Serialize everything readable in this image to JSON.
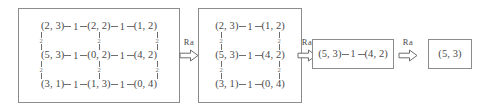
{
  "diagram": {
    "edge_label_horizontal": "1",
    "edge_label_vertical": "2",
    "arrow_label": "Ra",
    "arrows": [
      {
        "label": "Ra",
        "icon": "hollow-right-arrow-icon"
      },
      {
        "label": "Ra",
        "icon": "hollow-right-arrow-icon"
      },
      {
        "label": "Ra",
        "icon": "hollow-right-arrow-icon"
      }
    ],
    "steps": [
      {
        "id": "step-1",
        "rows": [
          {
            "nodes": [
              "(2, 3)",
              "(2, 2)",
              "(1, 2)"
            ],
            "h_labels": [
              "1",
              "1"
            ]
          },
          {
            "nodes": [
              "(5, 3)",
              "(0, 2)",
              "(4, 2)"
            ],
            "h_labels": [
              "1",
              "1"
            ]
          },
          {
            "nodes": [
              "(3, 1)",
              "(1, 3)",
              "(0, 4)"
            ],
            "h_labels": [
              "1",
              "1"
            ]
          }
        ],
        "v_labels": [
          [
            "2",
            "2",
            "2"
          ],
          [
            "2",
            "2",
            "2"
          ]
        ]
      },
      {
        "id": "step-2",
        "rows": [
          {
            "nodes": [
              "(2, 3)",
              "(1, 2)"
            ],
            "h_labels": [
              "1"
            ]
          },
          {
            "nodes": [
              "(5, 3)",
              "(4, 2)"
            ],
            "h_labels": [
              "1"
            ]
          },
          {
            "nodes": [
              "(3, 1)",
              "(0, 4)"
            ],
            "h_labels": [
              "1"
            ]
          }
        ],
        "v_labels": [
          [
            "2",
            "2"
          ],
          [
            "2",
            "2"
          ]
        ]
      },
      {
        "id": "step-3",
        "rows": [
          {
            "nodes": [
              "(5, 3)",
              "(4, 2)"
            ],
            "h_labels": [
              "1"
            ]
          }
        ],
        "v_labels": []
      },
      {
        "id": "step-4",
        "rows": [
          {
            "nodes": [
              "(5, 3)"
            ],
            "h_labels": []
          }
        ],
        "v_labels": []
      }
    ]
  },
  "colors": {
    "text": "#4a4a4a",
    "border": "#8c8c8c",
    "edge": "#6e6e6e",
    "background": "#ffffff"
  }
}
